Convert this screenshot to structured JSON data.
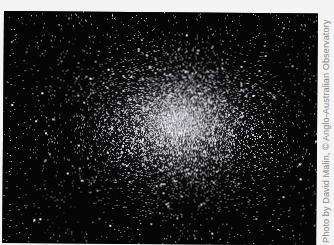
{
  "image": {
    "subject": "globular star cluster",
    "background_color": "#f4f4f4",
    "sky_color": "#050505",
    "cluster": {
      "center_x": 178,
      "center_y": 122,
      "radius_x": 120,
      "radius_y": 92,
      "core_glow_color": "#d8d8d8",
      "star_count": 9000,
      "field_star_count": 1400,
      "seed": 42
    }
  },
  "credit": {
    "text": "Photo by David Malin, © Anglo-Australian Observatory",
    "color": "#8a8a8a",
    "orientation": "vertical, bottom-to-top"
  }
}
